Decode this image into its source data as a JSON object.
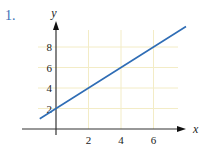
{
  "problem_number": "1.",
  "colors": {
    "line": "#2f6db5",
    "grid": "#f3ecc6",
    "axis": "#333333",
    "number": "#3b6fb6"
  },
  "chart_data": {
    "type": "line",
    "title": "",
    "xlabel": "x",
    "ylabel": "y",
    "x_ticks": [
      2,
      4,
      6
    ],
    "y_ticks": [
      2,
      4,
      6,
      8
    ],
    "xlim": [
      -1,
      8
    ],
    "ylim": [
      0,
      10.5
    ],
    "grid": true,
    "series": [
      {
        "name": "y = x + 2",
        "x": [
          -1,
          0,
          2,
          4,
          6,
          8
        ],
        "values": [
          1,
          2,
          4,
          6,
          8,
          10
        ]
      }
    ]
  }
}
